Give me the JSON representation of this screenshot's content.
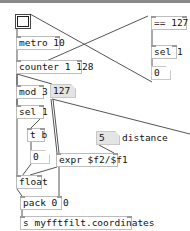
{
  "patch": {
    "objects": {
      "bang": {
        "type": "bng"
      },
      "metro": {
        "text": "metro 10"
      },
      "counter": {
        "text": "counter 1 128"
      },
      "eq": {
        "text": "== 127"
      },
      "sel_top": {
        "text": "sel 1"
      },
      "msg_zero_top": {
        "text": "0"
      },
      "mod": {
        "text": "mod 3"
      },
      "num_127": {
        "text": "127"
      },
      "num_5": {
        "text": "5"
      },
      "distance_label": {
        "text": "distance"
      },
      "sel_mid": {
        "text": "sel 1"
      },
      "trigger": {
        "text": "t b"
      },
      "num_zero": {
        "text": "0"
      },
      "expr": {
        "text": "expr $f2/$f1"
      },
      "float": {
        "text": "float"
      },
      "pack": {
        "text": "pack 0 0"
      },
      "send": {
        "text": "s myfftfilt.coordinates"
      }
    }
  },
  "colors": {
    "wire": "#555555",
    "box_border": "#bdbdbd",
    "number_bg": "#e4e4e4"
  }
}
